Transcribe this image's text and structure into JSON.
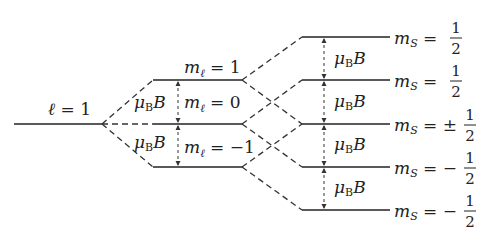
{
  "diagram": {
    "type": "energy-level-splitting",
    "left_level": {
      "label": "ℓ = 1"
    },
    "middle_levels": [
      {
        "label": "mℓ = 1"
      },
      {
        "label": "mℓ = 0"
      },
      {
        "label": "mℓ = −1"
      }
    ],
    "middle_gaps": [
      {
        "label": "μB B"
      },
      {
        "label": "μB B"
      }
    ],
    "right_levels": [
      {
        "ms_sign": "",
        "ms_num": "1",
        "ms_den": "2"
      },
      {
        "ms_sign": "",
        "ms_num": "1",
        "ms_den": "2"
      },
      {
        "ms_sign": "±",
        "ms_num": "1",
        "ms_den": "2"
      },
      {
        "ms_sign": "−",
        "ms_num": "1",
        "ms_den": "2"
      },
      {
        "ms_sign": "−",
        "ms_num": "1",
        "ms_den": "2"
      }
    ],
    "right_gaps": [
      {
        "label": "μB B"
      },
      {
        "label": "μB B"
      },
      {
        "label": "μB B"
      },
      {
        "label": "μB B"
      }
    ],
    "ms_prefix": "mS =",
    "ell": "ℓ",
    "equals_one": " = 1",
    "m": "m",
    "sub_ell": "ℓ",
    "sub_S": "S",
    "mu": "μ",
    "sub_B": "B",
    "B": "B",
    "eq": " = ",
    "v1": "1",
    "v0": "0",
    "vm1": "−1"
  }
}
